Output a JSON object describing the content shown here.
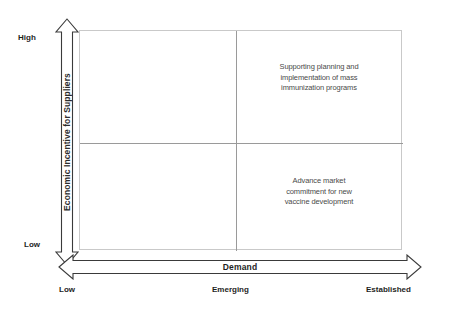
{
  "diagram": {
    "y_axis": {
      "label": "Economic Incentive for Suppliers",
      "high_label": "High",
      "low_label": "Low"
    },
    "x_axis": {
      "label": "Demand",
      "ticks": [
        "Low",
        "Emerging",
        "Established"
      ]
    },
    "quadrants": {
      "upper_right": {
        "lines": [
          "Supporting planning and",
          "implementation of mass",
          "immunization programs"
        ]
      },
      "lower_right": {
        "lines": [
          "Advance market",
          "commitment for new",
          "vaccine development"
        ]
      },
      "upper_left": {
        "lines": []
      },
      "lower_left": {
        "lines": []
      }
    },
    "colors": {
      "background": "#ffffff",
      "box_border": "#c9c9c9",
      "divider": "#9a9a9a",
      "arrow_stroke": "#3a3a3a",
      "arrow_fill": "#ffffff",
      "body_text": "#4a4a4a",
      "label_text": "#1e1e1e"
    }
  }
}
